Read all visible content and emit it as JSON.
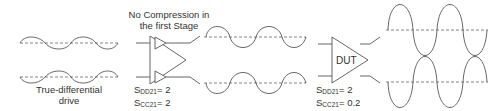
{
  "diagram": {
    "stage1": {
      "caption_line1": "True-differential",
      "caption_line2": "drive"
    },
    "stage2": {
      "title_line1": "No Compression in",
      "title_line2": "the first Stage",
      "param1_S": "S",
      "param1_sub": "DD21",
      "param1_val": "= 2",
      "param2_S": "S",
      "param2_sub": "CC21",
      "param2_val": "= 2"
    },
    "dut": {
      "label": "DUT",
      "param1_S": "S",
      "param1_sub": "DD21",
      "param1_val": "= 2",
      "param2_S": "S",
      "param2_sub": "CC21",
      "param2_val": "= 0.2"
    },
    "colors": {
      "stroke": "#555555",
      "dashed": "#777777",
      "text": "#333333"
    }
  }
}
